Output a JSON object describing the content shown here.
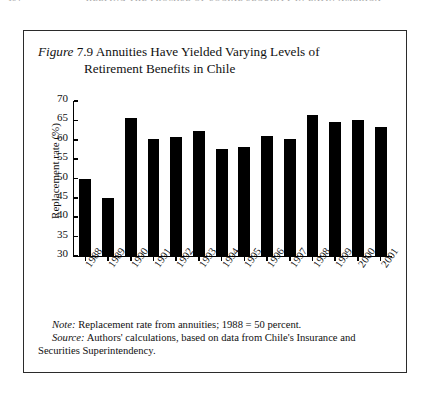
{
  "running_head": {
    "folio": "154",
    "title": "KEEPING THE PROMISE OF SOCIAL SECURITY IN LATIN AMERICA"
  },
  "figure": {
    "label": "Figure",
    "number": "7.9",
    "caption_line1": "Annuities Have Yielded Varying Levels of",
    "caption_line2": "Retirement Benefits in Chile"
  },
  "notes": {
    "note_label": "Note:",
    "note_text": "Replacement rate from annuities; 1988 = 50 percent.",
    "source_label": "Source:",
    "source_text": "Authors' calculations, based on data from Chile's Insurance and Securities Superintendency."
  },
  "chart_data": {
    "type": "bar",
    "title": "Annuities Have Yielded Varying Levels of Retirement Benefits in Chile",
    "xlabel": "",
    "ylabel": "Replacement rate (%)",
    "categories": [
      "1988",
      "1989",
      "1990",
      "1991",
      "1992",
      "1993",
      "1994",
      "1995",
      "1996",
      "1997",
      "1998",
      "1999",
      "2000",
      "2001"
    ],
    "values": [
      50.0,
      45.0,
      65.5,
      60.3,
      60.7,
      62.3,
      57.5,
      58.2,
      61.0,
      60.3,
      66.5,
      64.5,
      65.2,
      63.3
    ],
    "ylim": [
      30,
      70
    ],
    "yticks": [
      30,
      35,
      40,
      45,
      50,
      55,
      60,
      65,
      70
    ],
    "grid": false,
    "legend": false,
    "bar_color": "#000000"
  }
}
